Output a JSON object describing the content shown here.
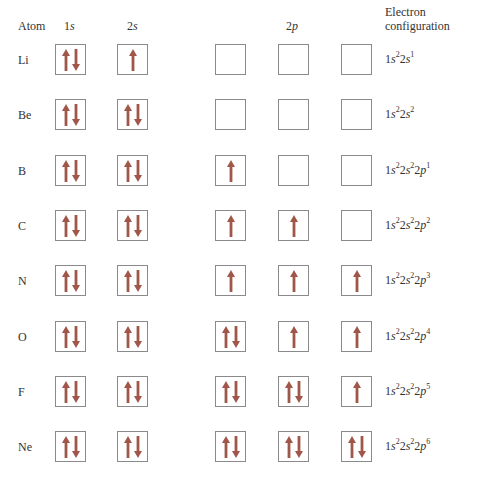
{
  "headers": {
    "atom": "Atom",
    "s1": "1s",
    "s2": "2s",
    "p2": "2p",
    "config_line1": "Electron",
    "config_line2": "configuration"
  },
  "arrow_color": "#a0574a",
  "rows": [
    {
      "atom": "Li",
      "s1": "ud",
      "s2": "u",
      "p": [
        "",
        "",
        ""
      ],
      "config": [
        [
          "1",
          "s",
          "2"
        ],
        [
          "2",
          "s",
          "1"
        ]
      ]
    },
    {
      "atom": "Be",
      "s1": "ud",
      "s2": "ud",
      "p": [
        "",
        "",
        ""
      ],
      "config": [
        [
          "1",
          "s",
          "2"
        ],
        [
          "2",
          "s",
          "2"
        ]
      ]
    },
    {
      "atom": "B",
      "s1": "ud",
      "s2": "ud",
      "p": [
        "u",
        "",
        ""
      ],
      "config": [
        [
          "1",
          "s",
          "2"
        ],
        [
          "2",
          "s",
          "2"
        ],
        [
          "2",
          "p",
          "1"
        ]
      ]
    },
    {
      "atom": "C",
      "s1": "ud",
      "s2": "ud",
      "p": [
        "u",
        "u",
        ""
      ],
      "config": [
        [
          "1",
          "s",
          "2"
        ],
        [
          "2",
          "s",
          "2"
        ],
        [
          "2",
          "p",
          "2"
        ]
      ]
    },
    {
      "atom": "N",
      "s1": "ud",
      "s2": "ud",
      "p": [
        "u",
        "u",
        "u"
      ],
      "config": [
        [
          "1",
          "s",
          "2"
        ],
        [
          "2",
          "s",
          "2"
        ],
        [
          "2",
          "p",
          "3"
        ]
      ]
    },
    {
      "atom": "O",
      "s1": "ud",
      "s2": "ud",
      "p": [
        "ud",
        "u",
        "u"
      ],
      "config": [
        [
          "1",
          "s",
          "2"
        ],
        [
          "2",
          "s",
          "2"
        ],
        [
          "2",
          "p",
          "4"
        ]
      ]
    },
    {
      "atom": "F",
      "s1": "ud",
      "s2": "ud",
      "p": [
        "ud",
        "ud",
        "u"
      ],
      "config": [
        [
          "1",
          "s",
          "2"
        ],
        [
          "2",
          "s",
          "2"
        ],
        [
          "2",
          "p",
          "5"
        ]
      ]
    },
    {
      "atom": "Ne",
      "s1": "ud",
      "s2": "ud",
      "p": [
        "ud",
        "ud",
        "ud"
      ],
      "config": [
        [
          "1",
          "s",
          "2"
        ],
        [
          "2",
          "s",
          "2"
        ],
        [
          "2",
          "p",
          "6"
        ]
      ]
    }
  ]
}
